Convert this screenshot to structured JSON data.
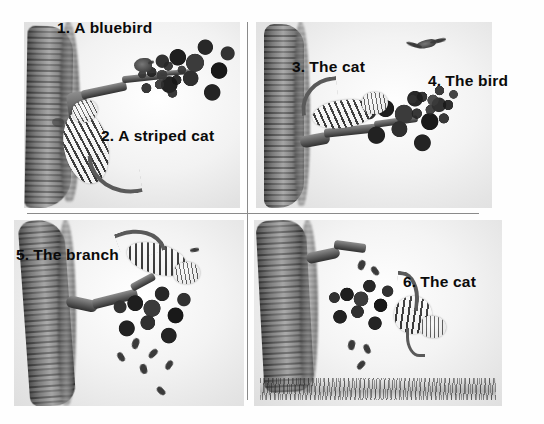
{
  "page": {
    "background_color": "#fefefe",
    "divider_color": "#8a8a8a",
    "label_color": "#0a0a0a",
    "art_style": "grayscale-pencil-illustration"
  },
  "panels": [
    {
      "id": "panel-1",
      "position": "top-left",
      "labels": [
        {
          "id": "label-1",
          "num": "1.",
          "text": "A bluebird"
        },
        {
          "id": "label-2",
          "num": "2.",
          "text": "A striped cat"
        }
      ],
      "scene_description": "A bluebird perched on a leafy branch of a tree while a striped cat climbs up the trunk"
    },
    {
      "id": "panel-2",
      "position": "top-right",
      "labels": [
        {
          "id": "label-3",
          "num": "3.",
          "text": "The cat"
        },
        {
          "id": "label-4",
          "num": "4.",
          "text": "The bird"
        }
      ],
      "scene_description": "The cat crouches on the branch as the bird flies away"
    },
    {
      "id": "panel-3",
      "position": "bottom-left",
      "labels": [
        {
          "id": "label-5",
          "num": "5.",
          "text": "The branch"
        }
      ],
      "scene_description": "The cat scrambles on the branch and leaves begin to fall"
    },
    {
      "id": "panel-4",
      "position": "bottom-right",
      "labels": [
        {
          "id": "label-6",
          "num": "6.",
          "text": "The cat"
        }
      ],
      "scene_description": "The cat falls from the broken branch toward the grass below"
    }
  ]
}
